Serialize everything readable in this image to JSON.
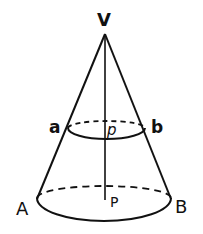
{
  "diagram": {
    "labels": {
      "vertex": "V",
      "upper_left": "a",
      "upper_right": "b",
      "upper_center": "p",
      "lower_left": "A",
      "lower_right": "B",
      "lower_center": "P"
    },
    "colors": {
      "stroke": "#111111",
      "background": "#ffffff"
    }
  }
}
